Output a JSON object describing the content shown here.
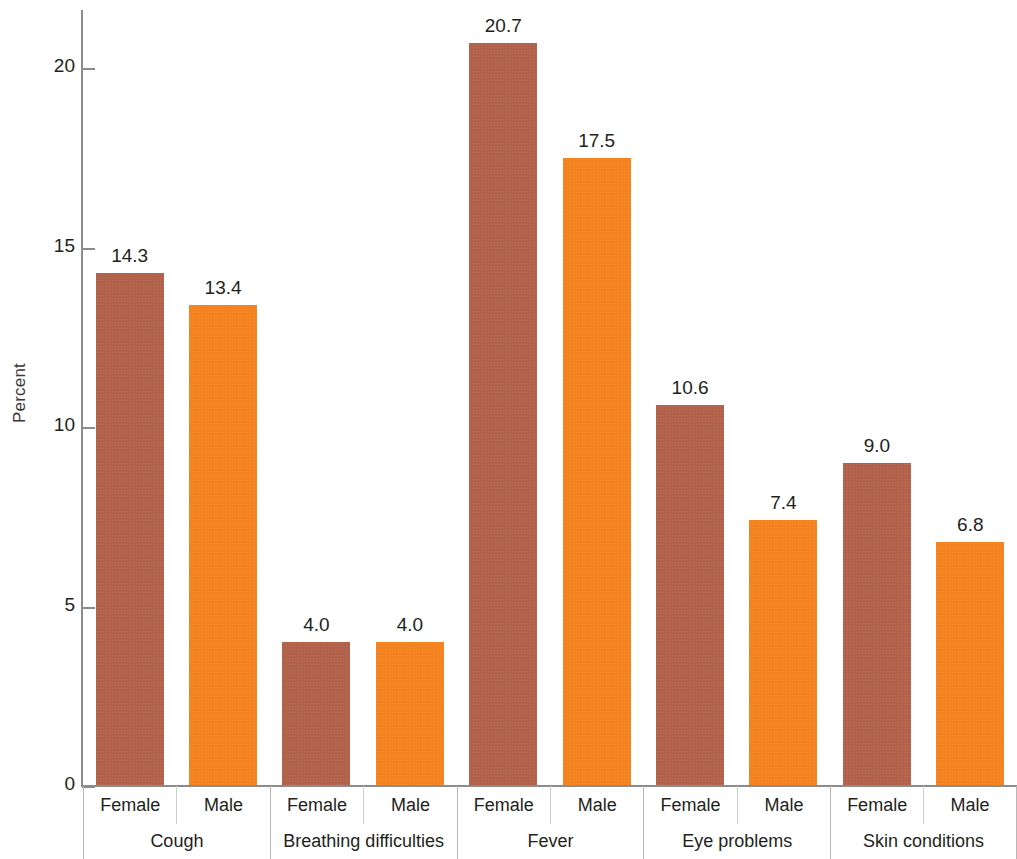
{
  "chart_data": {
    "type": "bar",
    "title": "",
    "xlabel": "",
    "ylabel": "Percent",
    "ylim": [
      0,
      21.5
    ],
    "yticks": [
      0,
      5,
      10,
      15,
      20
    ],
    "ytick_labels": [
      "0",
      "5",
      "10",
      "15",
      "20"
    ],
    "grid": false,
    "legend": "none",
    "categories": [
      "Cough",
      "Breathing difficulties",
      "Fever",
      "Eye problems",
      "Skin conditions"
    ],
    "subcategories": [
      "Female",
      "Male"
    ],
    "series": [
      {
        "name": "Female",
        "color": "#b2614a",
        "values": [
          14.3,
          4.0,
          20.7,
          10.6,
          9.0
        ]
      },
      {
        "name": "Male",
        "color": "#f4821f",
        "values": [
          13.4,
          4.0,
          17.5,
          7.4,
          6.8
        ]
      }
    ],
    "data_labels": [
      "14.3",
      "13.4",
      "4.0",
      "4.0",
      "20.7",
      "17.5",
      "10.6",
      "7.4",
      "9.0",
      "6.8"
    ],
    "bars": [
      {
        "group": "Cough",
        "sub": "Female",
        "value": 14.3,
        "label": "14.3",
        "color": "#b2614a"
      },
      {
        "group": "Cough",
        "sub": "Male",
        "value": 13.4,
        "label": "13.4",
        "color": "#f4821f"
      },
      {
        "group": "Breathing difficulties",
        "sub": "Female",
        "value": 4.0,
        "label": "4.0",
        "color": "#b2614a"
      },
      {
        "group": "Breathing difficulties",
        "sub": "Male",
        "value": 4.0,
        "label": "4.0",
        "color": "#f4821f"
      },
      {
        "group": "Fever",
        "sub": "Female",
        "value": 20.7,
        "label": "20.7",
        "color": "#b2614a"
      },
      {
        "group": "Fever",
        "sub": "Male",
        "value": 17.5,
        "label": "17.5",
        "color": "#f4821f"
      },
      {
        "group": "Eye problems",
        "sub": "Female",
        "value": 10.6,
        "label": "10.6",
        "color": "#b2614a"
      },
      {
        "group": "Eye problems",
        "sub": "Male",
        "value": 7.4,
        "label": "7.4",
        "color": "#f4821f"
      },
      {
        "group": "Skin conditions",
        "sub": "Female",
        "value": 9.0,
        "label": "9.0",
        "color": "#b2614a"
      },
      {
        "group": "Skin conditions",
        "sub": "Male",
        "value": 6.8,
        "label": "6.8",
        "color": "#f4821f"
      }
    ]
  },
  "axis": {
    "y_title": "Percent"
  },
  "colors": {
    "female_bar": "#b2614a",
    "male_bar": "#f4821f",
    "axis_line": "#8d8c8c",
    "text": "#231f20",
    "background": "#ffffff"
  }
}
